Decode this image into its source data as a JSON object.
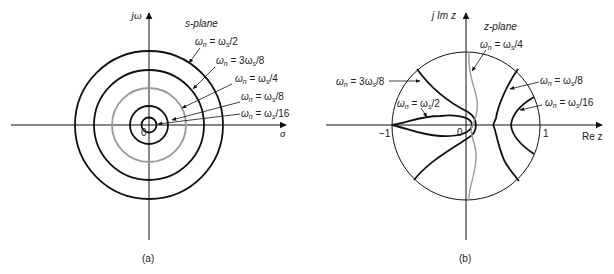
{
  "figure": {
    "panel_a": {
      "caption": "(a)",
      "plane_label": "s-plane",
      "x_axis_label": "σ",
      "y_axis_label": "jω",
      "origin_label": "0",
      "curves": [
        {
          "id": "wn_ws_2",
          "label": "ωn = ωs/2",
          "shape": "circle",
          "relative_radius": 0.5,
          "color": "#111111"
        },
        {
          "id": "wn_3ws_8",
          "label": "ωn = 3ωs/8",
          "shape": "circle",
          "relative_radius": 0.375,
          "color": "#111111"
        },
        {
          "id": "wn_ws_4",
          "label": "ωn = ωs/4",
          "shape": "circle",
          "relative_radius": 0.25,
          "color": "#9a9a9a"
        },
        {
          "id": "wn_ws_8",
          "label": "ωn = ωs/8",
          "shape": "circle",
          "relative_radius": 0.125,
          "color": "#111111"
        },
        {
          "id": "wn_ws_16",
          "label": "ωn = ωs/16",
          "shape": "circle",
          "relative_radius": 0.0625,
          "color": "#111111"
        }
      ]
    },
    "panel_b": {
      "caption": "(b)",
      "plane_label": "z-plane",
      "x_axis_label": "Re z",
      "y_axis_label": "j Im z",
      "origin_label": "0",
      "tick_neg_one": "−1",
      "tick_one": "1",
      "unit_circle": true,
      "curves": [
        {
          "id": "wn_3ws_8",
          "label": "ωn = 3ωs/8",
          "color": "#111111"
        },
        {
          "id": "wn_ws_2",
          "label": "ωn = ωs/2",
          "color": "#111111"
        },
        {
          "id": "wn_ws_4",
          "label": "ωn = ωs/4",
          "color": "#9a9a9a"
        },
        {
          "id": "wn_ws_8",
          "label": "ωn = ωs/8",
          "color": "#111111"
        },
        {
          "id": "wn_ws_16",
          "label": "ωn = ωs/16",
          "color": "#111111"
        }
      ]
    }
  },
  "labels": {
    "a": {
      "half": {
        "pre": "ω",
        "sub": "n",
        "mid": " = ω",
        "sub2": "s",
        "post": "/2"
      },
      "three_eighths": {
        "pre": "ω",
        "sub": "n",
        "mid": " = 3ω",
        "sub2": "s",
        "post": "/8"
      },
      "quarter": {
        "pre": "ω",
        "sub": "n",
        "mid": " = ω",
        "sub2": "s",
        "post": "/4"
      },
      "eighth": {
        "pre": "ω",
        "sub": "n",
        "mid": " = ω",
        "sub2": "s",
        "post": "/8"
      },
      "sixteenth": {
        "pre": "ω",
        "sub": "n",
        "mid": " = ω",
        "sub2": "s",
        "post": "/16"
      }
    },
    "b": {
      "quarter": {
        "pre": "ω",
        "sub": "n",
        "mid": " = ω",
        "sub2": "s",
        "post": "/4"
      },
      "three_eighths": {
        "pre": "ω",
        "sub": "n",
        "mid": " = 3ω",
        "sub2": "s",
        "post": "/8"
      },
      "half": {
        "pre": "ω",
        "sub": "n",
        "mid": " = ω",
        "sub2": "s",
        "post": "/2"
      },
      "eighth": {
        "pre": "ω",
        "sub": "n",
        "mid": " = ω",
        "sub2": "s",
        "post": "/8"
      },
      "sixteenth": {
        "pre": "ω",
        "sub": "n",
        "mid": " = ω",
        "sub2": "s",
        "post": "/16"
      }
    }
  },
  "colors": {
    "ink": "#111111",
    "gray_curve": "#9a9a9a",
    "background": "#ffffff"
  }
}
